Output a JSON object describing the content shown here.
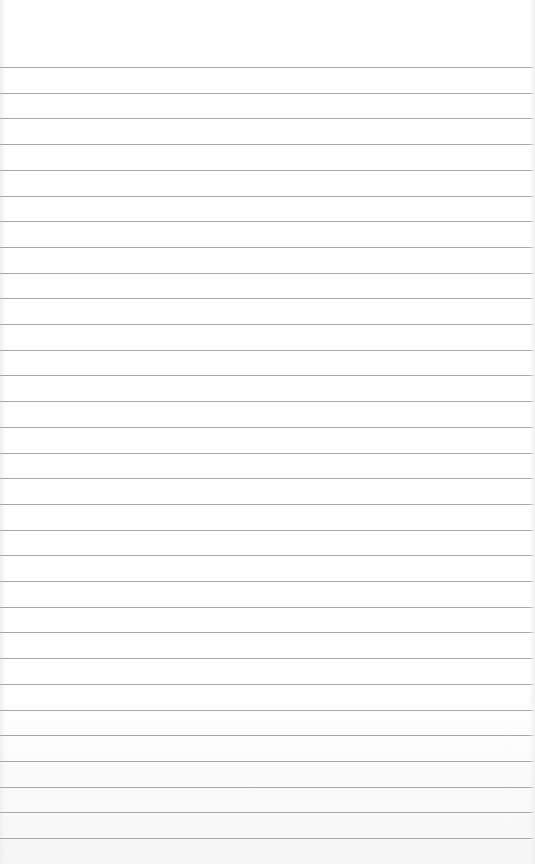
{
  "paper": {
    "type": "ruled-notebook-paper",
    "line_count": 31,
    "first_line_y": 67,
    "line_spacing": 25.7,
    "line_color": "#a8a8a8",
    "background_color": "#ffffff"
  }
}
